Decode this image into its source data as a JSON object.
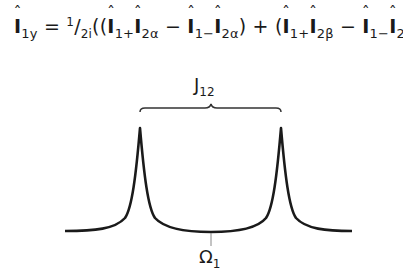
{
  "equation": {
    "lhs_operator": "I",
    "lhs_sub": "1y",
    "equals": "=",
    "coef_num": "1",
    "coef_slash": "/",
    "coef_den": "2i",
    "open": "((",
    "t1_a": "I",
    "t1_a_sub": "1+",
    "t1_b": "I",
    "t1_b_sub": "2α",
    "minus1": " − ",
    "t2_a": "I",
    "t2_a_sub": "1−",
    "t2_b": "I",
    "t2_b_sub": "2α",
    "mid": ") + (",
    "t3_a": "I",
    "t3_a_sub": "1+",
    "t3_b": "I",
    "t3_b_sub": "2β",
    "minus2": " − ",
    "t4_a": "I",
    "t4_a_sub": "1−",
    "t4_b": "I",
    "t4_b_sub": "2β",
    "close": "))"
  },
  "diagram": {
    "coupling_label": "J",
    "coupling_sub": "12",
    "center_label": "Ω",
    "center_sub": "1",
    "line_color": "#1a1a1a",
    "tick_color": "#888888"
  }
}
